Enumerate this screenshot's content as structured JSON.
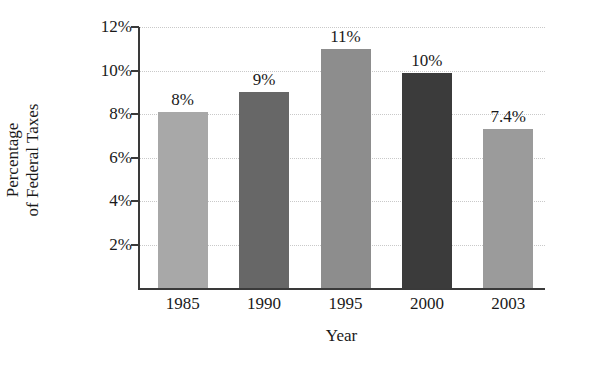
{
  "chart_data": {
    "type": "bar",
    "title": "",
    "xlabel": "Year",
    "ylabel": "Percentage of Federal Taxes",
    "ylabel_lines": [
      "Percentage",
      "of Federal Taxes"
    ],
    "categories": [
      "1985",
      "1990",
      "1995",
      "2000",
      "2003"
    ],
    "values": [
      8.1,
      9.0,
      11.0,
      9.9,
      7.3
    ],
    "data_labels": [
      "8%",
      "9%",
      "11%",
      "10%",
      "7.4%"
    ],
    "bar_colors": [
      "#a8a8a8",
      "#676767",
      "#8d8d8d",
      "#3b3b3b",
      "#9b9b9b"
    ],
    "ylim": [
      0,
      12
    ],
    "y_ticks": [
      2,
      4,
      6,
      8,
      10,
      12
    ],
    "y_tick_labels": [
      "2%",
      "4%",
      "6%",
      "8%",
      "10%",
      "12%"
    ],
    "grid": true,
    "grid_color": "#c9c9c9",
    "axis_color": "#3a3a3a",
    "legend": null,
    "legend_position": "none",
    "background": "#ffffff"
  }
}
